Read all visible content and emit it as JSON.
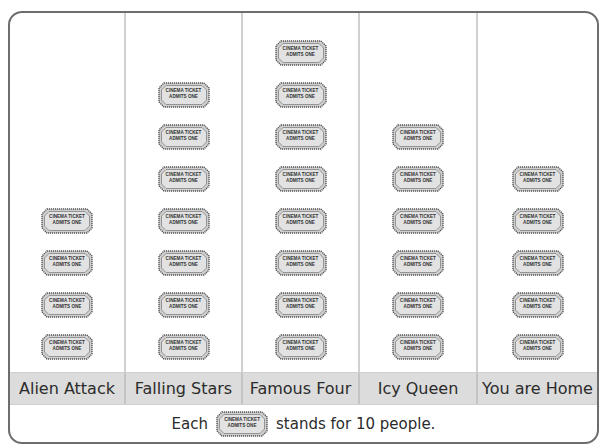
{
  "chart_data": {
    "type": "pictograph",
    "title": "",
    "categories": [
      "Alien Attack",
      "Falling Stars",
      "Famous Four",
      "Icy Queen",
      "You are Home"
    ],
    "icon_counts": [
      4,
      7,
      8,
      6,
      5
    ],
    "values": [
      40,
      70,
      80,
      60,
      50
    ],
    "icon": "cinema-ticket",
    "icon_value": 10,
    "key_text": "Each [ticket] stands for 10 people.",
    "grid": false,
    "legend_position": "bottom"
  },
  "ticket": {
    "line1": "CINEMA TICKET",
    "line2": "ADMITS ONE",
    "fill": "#cfcfcf",
    "stroke": "#555555"
  },
  "key": {
    "prefix": "Each",
    "suffix": "stands for 10 people."
  },
  "colors": {
    "frame": "#6d6d6d",
    "label_band": "#dcdcdc",
    "divider": "#d0d0d0"
  }
}
